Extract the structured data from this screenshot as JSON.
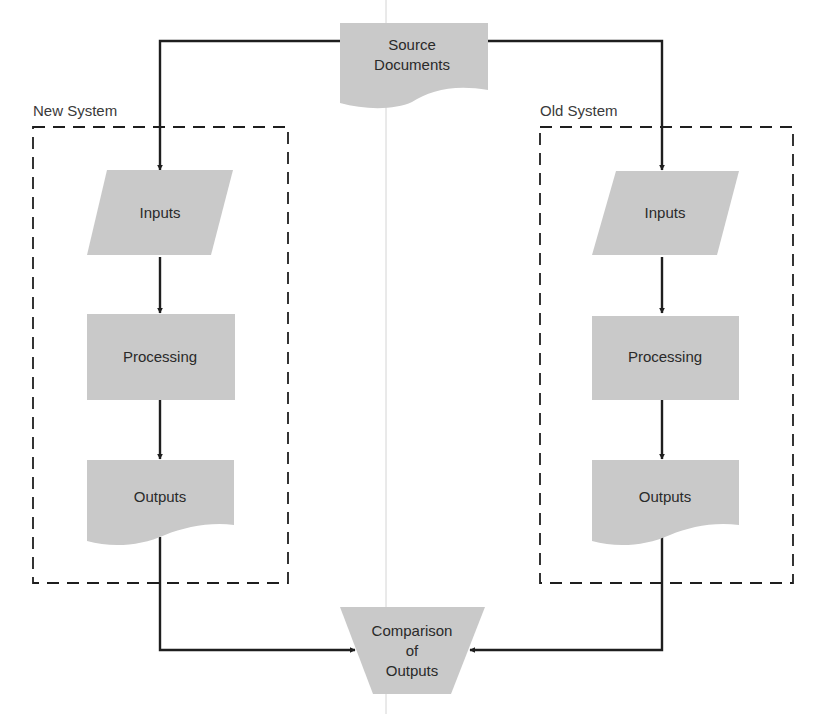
{
  "diagram": {
    "type": "flowchart",
    "colors": {
      "shape_fill": "#c9c9c9",
      "line": "#1e1e1e",
      "text": "#2a2a2a"
    },
    "source": {
      "shape": "document",
      "lines": [
        "Source",
        "Documents"
      ]
    },
    "groups": {
      "new_system": {
        "label": "New System",
        "steps": [
          {
            "shape": "parallelogram",
            "label": "Inputs"
          },
          {
            "shape": "rectangle",
            "label": "Processing"
          },
          {
            "shape": "document",
            "label": "Outputs"
          }
        ]
      },
      "old_system": {
        "label": "Old System",
        "steps": [
          {
            "shape": "parallelogram",
            "label": "Inputs"
          },
          {
            "shape": "rectangle",
            "label": "Processing"
          },
          {
            "shape": "document",
            "label": "Outputs"
          }
        ]
      }
    },
    "comparison": {
      "shape": "manual-operation",
      "lines": [
        "Comparison",
        "of",
        "Outputs"
      ]
    },
    "edges": [
      {
        "from": "Source Documents",
        "to": "New System Inputs"
      },
      {
        "from": "Source Documents",
        "to": "Old System Inputs"
      },
      {
        "from": "New System Inputs",
        "to": "New System Processing"
      },
      {
        "from": "New System Processing",
        "to": "New System Outputs"
      },
      {
        "from": "Old System Inputs",
        "to": "Old System Processing"
      },
      {
        "from": "Old System Processing",
        "to": "Old System Outputs"
      },
      {
        "from": "New System Outputs",
        "to": "Comparison of Outputs"
      },
      {
        "from": "Old System Outputs",
        "to": "Comparison of Outputs"
      }
    ]
  }
}
